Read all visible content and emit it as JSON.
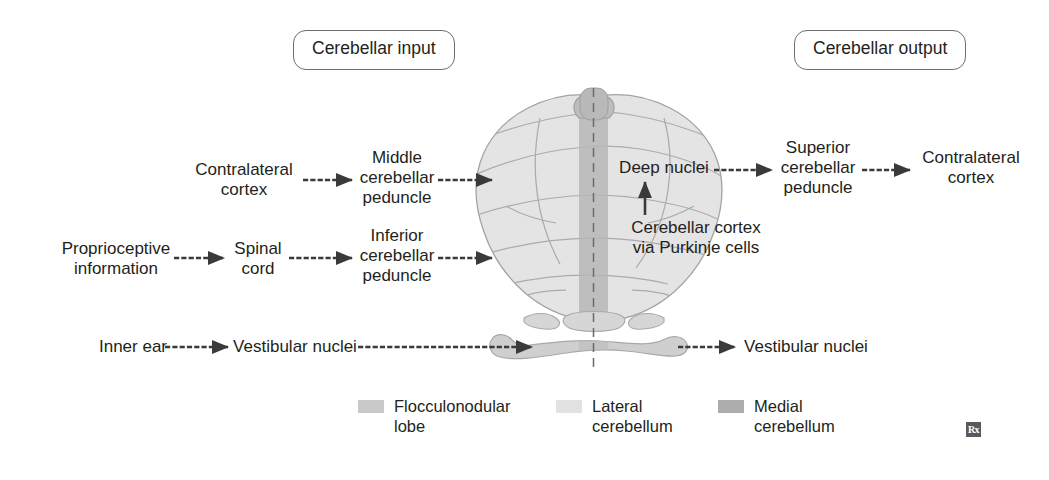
{
  "figure": {
    "title_left": "Cerebellar input",
    "title_right": "Cerebellar output",
    "watermark": "Rx"
  },
  "headers": {
    "input": "Cerebellar input",
    "output": "Cerebellar output"
  },
  "input_pathways": [
    {
      "id": "cortico-ponto-cerebellar",
      "steps": [
        "Contralateral\ncortex",
        "Middle\ncerebellar\npeduncle"
      ]
    },
    {
      "id": "spinocerebellar",
      "steps": [
        "Proprioceptive\ninformation",
        "Spinal\ncord",
        "Inferior\ncerebellar\npeduncle"
      ]
    },
    {
      "id": "vestibulocerebellar",
      "steps": [
        "Inner ear",
        "Vestibular nuclei"
      ]
    }
  ],
  "labels": {
    "contralateral_cortex_in": "Contralateral\ncortex",
    "middle_peduncle": "Middle\ncerebellar\npeduncle",
    "proprioceptive_information": "Proprioceptive\ninformation",
    "spinal_cord": "Spinal\ncord",
    "inferior_peduncle": "Inferior\ncerebellar\npeduncle",
    "inner_ear": "Inner ear",
    "vestibular_nuclei_in": "Vestibular nuclei",
    "deep_nuclei": "Deep nuclei",
    "cerebellar_cortex_purkinje": "Cerebellar cortex\nvia Purkinje cells",
    "superior_peduncle": "Superior\ncerebellar\npeduncle",
    "contralateral_cortex_out": "Contralateral\ncortex",
    "vestibular_nuclei_out": "Vestibular nuclei"
  },
  "output_pathways": [
    {
      "id": "dentato-thalamo-cortical",
      "steps": [
        "Deep nuclei",
        "Superior\ncerebellar\npeduncle",
        "Contralateral\ncortex"
      ]
    },
    {
      "id": "cerebello-vestibular",
      "steps": [
        "Vestibular nuclei"
      ]
    }
  ],
  "legend": {
    "items": [
      {
        "label": "Flocculonodular\nlobe",
        "color": "#c9c9c9"
      },
      {
        "label": "Lateral\ncerebellum",
        "color": "#e2e2e2"
      },
      {
        "label": "Medial\ncerebellum",
        "color": "#adadad"
      }
    ]
  },
  "colors": {
    "lateral_cerebellum": "#e2e2e2",
    "medial_cerebellum": "#b4b4b4",
    "flocculonodular_lobe": "#cccccc",
    "outline": "#9a9a9a",
    "folia": "#a6a6a6",
    "arrow": "#3a3a3a",
    "text": "#231f20",
    "pill_border": "#6d6e71",
    "midline_dash": "#6b6b6b",
    "background": "#ffffff"
  }
}
